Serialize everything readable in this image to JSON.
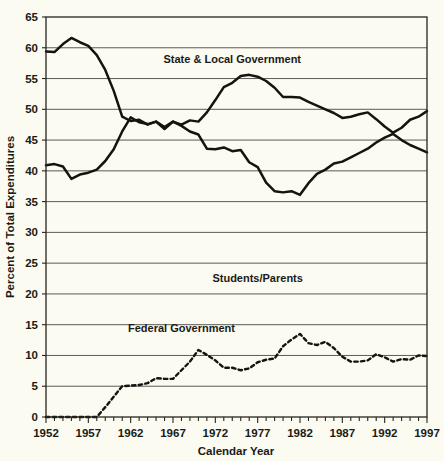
{
  "chart_data": {
    "type": "line",
    "title": "",
    "xlabel": "Calendar Year",
    "ylabel": "Percent of Total Expenditures",
    "xlim": [
      1952,
      1997
    ],
    "ylim": [
      0,
      65
    ],
    "ytick_step": 5,
    "yticks": [
      0,
      5,
      10,
      15,
      20,
      25,
      30,
      35,
      40,
      45,
      50,
      55,
      60,
      65
    ],
    "xticks": [
      1952,
      1957,
      1962,
      1967,
      1972,
      1977,
      1982,
      1987,
      1992,
      1997
    ],
    "xtick_minor_every": 1,
    "grid": "horizontal",
    "legend_position": "inline-annotations",
    "x": [
      1952,
      1953,
      1954,
      1955,
      1956,
      1957,
      1958,
      1959,
      1960,
      1961,
      1962,
      1963,
      1964,
      1965,
      1966,
      1967,
      1968,
      1969,
      1970,
      1971,
      1972,
      1973,
      1974,
      1975,
      1976,
      1977,
      1978,
      1979,
      1980,
      1981,
      1982,
      1983,
      1984,
      1985,
      1986,
      1987,
      1988,
      1989,
      1990,
      1991,
      1992,
      1993,
      1994,
      1995,
      1996,
      1997
    ],
    "series": [
      {
        "name": "Students/Parents",
        "style": "solid",
        "label_x": 1977,
        "label_y": 22,
        "values": [
          59.4,
          59.3,
          60.6,
          61.6,
          60.9,
          60.3,
          58.8,
          56.4,
          53.0,
          48.8,
          48.1,
          48.3,
          47.5,
          48.0,
          46.8,
          48.0,
          47.3,
          46.4,
          45.9,
          43.6,
          43.5,
          43.8,
          43.2,
          43.4,
          41.4,
          40.6,
          38.1,
          36.7,
          36.5,
          36.7,
          36.1,
          38.0,
          39.5,
          40.2,
          41.2,
          41.5,
          42.2,
          42.9,
          43.6,
          44.6,
          45.4,
          46.0,
          45.0,
          44.2,
          43.6,
          43.0
        ]
      },
      {
        "name": "State & Local Government",
        "style": "solid",
        "label_x": 1974,
        "label_y": 57.5,
        "values": [
          40.9,
          41.1,
          40.7,
          38.7,
          39.4,
          39.7,
          40.2,
          41.6,
          43.5,
          46.4,
          48.7,
          47.9,
          47.6,
          48.0,
          47.1,
          48.0,
          47.5,
          48.2,
          48.0,
          49.5,
          51.5,
          53.6,
          54.3,
          55.4,
          55.6,
          55.3,
          54.6,
          53.5,
          52.0,
          52.0,
          51.9,
          51.2,
          50.6,
          50.0,
          49.4,
          48.6,
          48.8,
          49.2,
          49.5,
          48.4,
          47.2,
          46.2,
          47.0,
          48.3,
          48.8,
          49.7
        ]
      },
      {
        "name": "Federal Government",
        "style": "dashed",
        "label_x": 1968,
        "label_y": 13.8,
        "values": [
          0.0,
          0.0,
          0.0,
          0.0,
          0.0,
          0.0,
          0.0,
          1.6,
          3.3,
          5.0,
          5.1,
          5.2,
          5.5,
          6.3,
          6.2,
          6.2,
          7.6,
          9.0,
          10.9,
          10.1,
          9.2,
          8.0,
          8.0,
          7.6,
          7.9,
          8.9,
          9.3,
          9.5,
          11.5,
          12.6,
          13.5,
          12.0,
          11.7,
          12.2,
          11.2,
          9.8,
          9.0,
          9.0,
          9.2,
          10.2,
          9.7,
          9.0,
          9.4,
          9.3,
          10.0,
          9.9
        ]
      }
    ],
    "annotations": [
      {
        "text": "State & Local Government",
        "x": 1974,
        "y": 57.5
      },
      {
        "text": "Students/Parents",
        "x": 1977,
        "y": 22
      },
      {
        "text": "Federal Government",
        "x": 1968,
        "y": 13.8
      }
    ]
  }
}
